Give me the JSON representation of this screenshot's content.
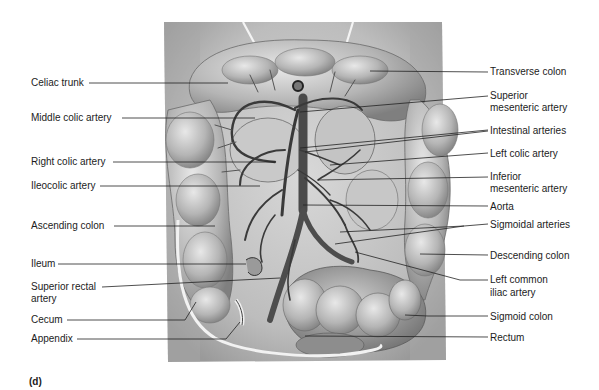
{
  "figure": {
    "panel_label": "(d)"
  },
  "labels_left": [
    {
      "text": "Celiac trunk",
      "x": 31,
      "y": 78,
      "line_to": [
        228,
        83
      ]
    },
    {
      "text": "Middle colic artery",
      "x": 31,
      "y": 112,
      "line_to": [
        255,
        118
      ]
    },
    {
      "text": "Right colic artery",
      "x": 31,
      "y": 155,
      "line_to": [
        275,
        162
      ]
    },
    {
      "text": "Ileocolic artery",
      "x": 31,
      "y": 180,
      "line_to": [
        260,
        186
      ]
    },
    {
      "text": "Ascending colon",
      "x": 31,
      "y": 221,
      "line_to": [
        215,
        226
      ]
    },
    {
      "text": "Ileum",
      "x": 31,
      "y": 258,
      "line_to": [
        246,
        264
      ]
    },
    {
      "text": "Superior rectal",
      "x": 31,
      "y": 281,
      "line_to": [
        280,
        278
      ]
    },
    {
      "text": "artery",
      "x": 31,
      "y": 293
    },
    {
      "text": "Cecum",
      "x": 31,
      "y": 314,
      "line_to": [
        185,
        301
      ]
    },
    {
      "text": "Appendix",
      "x": 31,
      "y": 334,
      "line_to": [
        240,
        320
      ]
    }
  ],
  "labels_right": [
    {
      "text": "Transverse colon",
      "x": 490,
      "y": 67,
      "line_from": [
        370,
        70
      ]
    },
    {
      "text": "Superior",
      "x": 490,
      "y": 90,
      "line_from": [
        300,
        112
      ]
    },
    {
      "text": "mesenteric artery",
      "x": 490,
      "y": 102
    },
    {
      "text": "Intestinal arteries",
      "x": 490,
      "y": 125,
      "line_from": [
        300,
        148
      ]
    },
    {
      "text": "Left colic artery",
      "x": 490,
      "y": 148,
      "line_from": [
        330,
        165
      ]
    },
    {
      "text": "Inferior",
      "x": 490,
      "y": 171,
      "line_from": [
        318,
        180
      ]
    },
    {
      "text": "mesenteric artery",
      "x": 490,
      "y": 183
    },
    {
      "text": "Aorta",
      "x": 490,
      "y": 201,
      "line_from": [
        303,
        205
      ]
    },
    {
      "text": "Sigmoidal arteries",
      "x": 490,
      "y": 219,
      "line_from": [
        340,
        232
      ]
    },
    {
      "text": "Descending colon",
      "x": 490,
      "y": 250,
      "line_from": [
        420,
        254
      ]
    },
    {
      "text": "Left common",
      "x": 490,
      "y": 274,
      "line_from": [
        355,
        252
      ]
    },
    {
      "text": "iliac artery",
      "x": 490,
      "y": 287
    },
    {
      "text": "Sigmoid colon",
      "x": 490,
      "y": 311,
      "line_from": [
        405,
        315
      ]
    },
    {
      "text": "Rectum",
      "x": 490,
      "y": 332,
      "line_from": [
        305,
        336
      ]
    }
  ]
}
